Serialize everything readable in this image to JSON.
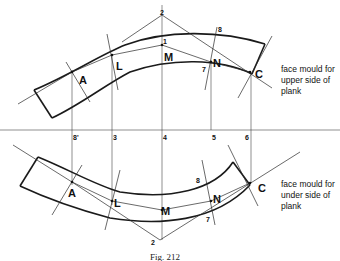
{
  "figure": {
    "caption": "Fig. 212",
    "upper_mould": {
      "points": [
        "A",
        "L",
        "M",
        "N",
        "C"
      ],
      "markers": [
        "1",
        "2",
        "7",
        "8"
      ],
      "note_lines": [
        "face mould for",
        "upper side of",
        "plank"
      ]
    },
    "lower_mould": {
      "points": [
        "A",
        "L",
        "M",
        "N",
        "C"
      ],
      "markers": [
        "2",
        "7",
        "8"
      ],
      "note_lines": [
        "face mould for",
        "under side of",
        "plank"
      ]
    },
    "baseline_ticks": [
      "8'",
      "3",
      "4",
      "5",
      "6"
    ]
  }
}
